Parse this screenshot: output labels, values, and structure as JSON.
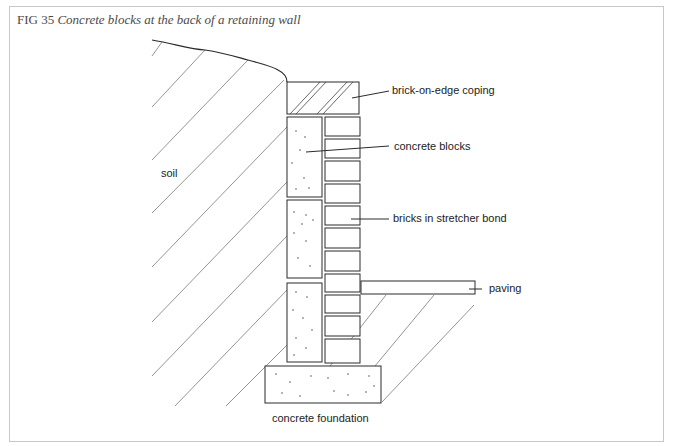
{
  "figure": {
    "number": "FIG 35",
    "title": "Concrete blocks at the back of a retaining wall"
  },
  "labels": {
    "coping": "brick-on-edge coping",
    "blocks": "concrete blocks",
    "bricks": "bricks in stretcher bond",
    "paving": "paving",
    "soil": "soil",
    "foundation": "concrete foundation"
  },
  "colors": {
    "line": "#2a2a2a",
    "hatch": "#7a7a7a",
    "frame": "#c8c8c8",
    "caption": "#4a4a4a"
  },
  "components": {
    "coping_count": 1,
    "concrete_block_count": 3,
    "brick_count": 11,
    "paving_count": 1,
    "foundation_count": 1
  }
}
